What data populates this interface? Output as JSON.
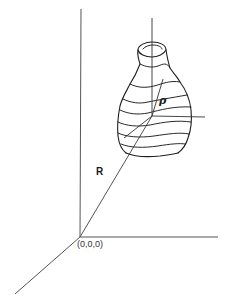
{
  "diagram": {
    "type": "3d-coordinate-system-with-object",
    "labels": {
      "position_vector": "R",
      "local_vector": "ρ",
      "origin": "(0,0,0)"
    },
    "global_axes": {
      "origin_px": [
        80,
        237
      ],
      "vertical_end_px": [
        81,
        9
      ],
      "horizontal_end_px": [
        218,
        237
      ],
      "depth_end_px": [
        15,
        294
      ]
    },
    "local_axes": {
      "origin_px": [
        152,
        116
      ],
      "vertical_end_px": [
        152,
        18
      ],
      "horizontal_end_px": [
        205,
        117
      ],
      "depth_end_px": [
        124,
        138
      ]
    },
    "vectors": [
      {
        "name": "R",
        "from": "global-origin",
        "to": "object-local-origin"
      },
      {
        "name": "ρ",
        "from": "object-local-origin",
        "to": "point-on-object-surface"
      }
    ],
    "object": {
      "description": "irregular vase/bottle-shaped body with horizontal contour rings",
      "contour_count": 8
    },
    "colors": {
      "line": "#1e1e1e",
      "axis": "#555555",
      "background": "#ffffff"
    }
  }
}
